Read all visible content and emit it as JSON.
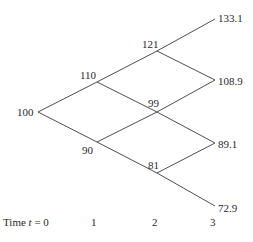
{
  "diagram": {
    "type": "binomial-tree",
    "line_color": "#3a3a3a",
    "nodes": {
      "t0": [
        "100"
      ],
      "t1": [
        "110",
        "90"
      ],
      "t2": [
        "121",
        "99",
        "81"
      ],
      "t3": [
        "133.1",
        "108.9",
        "89.1",
        "72.9"
      ]
    },
    "time_axis": {
      "label_prefix": "Time ",
      "variable": "t",
      "label_suffix": " = 0",
      "ticks": [
        "1",
        "2",
        "3"
      ]
    }
  }
}
